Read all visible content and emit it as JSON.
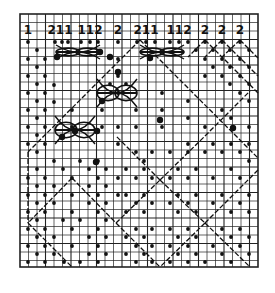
{
  "diagram": {
    "type": "bobbin-lace-pricking",
    "colors": {
      "background": "#ffffff",
      "ink": "#111111",
      "grid": "#222222"
    },
    "grid": {
      "x0": 20,
      "y0": 14,
      "x1": 258,
      "y1": 267,
      "cell": 8.5
    },
    "pair_labels": [
      {
        "text": "1",
        "x": 28
      },
      {
        "text": "211",
        "x": 60
      },
      {
        "text": "112",
        "x": 90
      },
      {
        "text": "2",
        "x": 118
      },
      {
        "text": "211",
        "x": 146
      },
      {
        "text": "112",
        "x": 179
      },
      {
        "text": "2",
        "x": 205
      },
      {
        "text": "2",
        "x": 222
      },
      {
        "text": "2",
        "x": 240
      }
    ],
    "label_y": 34,
    "diagonals": [
      [
        140,
        40,
        28,
        152
      ],
      [
        28,
        152,
        28,
        223
      ],
      [
        140,
        40,
        258,
        158
      ],
      [
        28,
        223,
        72,
        267
      ],
      [
        72,
        178,
        116,
        223
      ],
      [
        72,
        178,
        28,
        223
      ],
      [
        116,
        223,
        160,
        180
      ],
      [
        116,
        223,
        160,
        267
      ],
      [
        160,
        180,
        205,
        223
      ],
      [
        160,
        180,
        116,
        136
      ],
      [
        160,
        180,
        205,
        136
      ],
      [
        205,
        223,
        250,
        267
      ],
      [
        205,
        223,
        160,
        267
      ],
      [
        205,
        223,
        258,
        170
      ],
      [
        205,
        136,
        250,
        91
      ],
      [
        205,
        40,
        258,
        93
      ],
      [
        222,
        40,
        258,
        76
      ],
      [
        240,
        40,
        258,
        58
      ],
      [
        205,
        40,
        188,
        57
      ],
      [
        222,
        40,
        205,
        57
      ],
      [
        240,
        40,
        222,
        57
      ]
    ],
    "pins": [
      [
        28,
        42
      ],
      [
        55,
        42
      ],
      [
        62,
        42
      ],
      [
        68,
        42
      ],
      [
        81,
        42
      ],
      [
        90,
        42
      ],
      [
        98,
        42
      ],
      [
        118,
        42
      ],
      [
        137,
        42
      ],
      [
        146,
        42
      ],
      [
        155,
        42
      ],
      [
        170,
        42
      ],
      [
        179,
        42
      ],
      [
        188,
        42
      ],
      [
        205,
        42
      ],
      [
        222,
        42
      ],
      [
        240,
        42
      ],
      [
        37,
        50
      ],
      [
        28,
        59
      ],
      [
        45,
        59
      ],
      [
        37,
        67
      ],
      [
        28,
        76
      ],
      [
        45,
        76
      ],
      [
        37,
        84
      ],
      [
        28,
        93
      ],
      [
        45,
        93
      ],
      [
        54,
        85
      ],
      [
        37,
        101
      ],
      [
        28,
        110
      ],
      [
        45,
        110
      ],
      [
        54,
        102
      ],
      [
        37,
        118
      ],
      [
        28,
        127
      ],
      [
        45,
        127
      ],
      [
        37,
        135
      ],
      [
        28,
        144
      ],
      [
        45,
        144
      ],
      [
        37,
        152
      ],
      [
        118,
        59
      ],
      [
        118,
        76
      ],
      [
        110,
        84
      ],
      [
        126,
        84
      ],
      [
        118,
        93
      ],
      [
        102,
        110
      ],
      [
        136,
        110
      ],
      [
        118,
        127
      ],
      [
        102,
        127
      ],
      [
        136,
        127
      ],
      [
        118,
        144
      ],
      [
        72,
        127
      ],
      [
        72,
        110
      ],
      [
        196,
        50
      ],
      [
        213,
        50
      ],
      [
        230,
        50
      ],
      [
        249,
        50
      ],
      [
        205,
        59
      ],
      [
        222,
        59
      ],
      [
        240,
        59
      ],
      [
        213,
        67
      ],
      [
        230,
        67
      ],
      [
        249,
        67
      ],
      [
        222,
        76
      ],
      [
        240,
        76
      ],
      [
        230,
        84
      ],
      [
        249,
        84
      ],
      [
        240,
        93
      ],
      [
        249,
        101
      ],
      [
        205,
        76
      ],
      [
        188,
        101
      ],
      [
        162,
        93
      ],
      [
        162,
        110
      ],
      [
        188,
        118
      ],
      [
        162,
        127
      ],
      [
        205,
        127
      ],
      [
        231,
        118
      ],
      [
        222,
        110
      ],
      [
        249,
        127
      ],
      [
        188,
        144
      ],
      [
        213,
        144
      ],
      [
        231,
        144
      ],
      [
        249,
        144
      ],
      [
        54,
        161
      ],
      [
        80,
        161
      ],
      [
        98,
        161
      ],
      [
        37,
        169
      ],
      [
        63,
        169
      ],
      [
        89,
        169
      ],
      [
        106,
        169
      ],
      [
        28,
        178
      ],
      [
        45,
        178
      ],
      [
        72,
        178
      ],
      [
        98,
        178
      ],
      [
        118,
        178
      ],
      [
        37,
        186
      ],
      [
        54,
        186
      ],
      [
        89,
        186
      ],
      [
        106,
        186
      ],
      [
        28,
        195
      ],
      [
        45,
        195
      ],
      [
        72,
        195
      ],
      [
        98,
        195
      ],
      [
        118,
        195
      ],
      [
        37,
        203
      ],
      [
        54,
        203
      ],
      [
        89,
        203
      ],
      [
        106,
        203
      ],
      [
        28,
        212
      ],
      [
        45,
        212
      ],
      [
        72,
        212
      ],
      [
        98,
        212
      ],
      [
        37,
        220
      ],
      [
        63,
        220
      ],
      [
        80,
        220
      ],
      [
        106,
        220
      ],
      [
        28,
        229
      ],
      [
        45,
        229
      ],
      [
        72,
        229
      ],
      [
        98,
        229
      ],
      [
        37,
        237
      ],
      [
        54,
        237
      ],
      [
        89,
        237
      ],
      [
        106,
        237
      ],
      [
        28,
        246
      ],
      [
        45,
        246
      ],
      [
        72,
        246
      ],
      [
        98,
        246
      ],
      [
        37,
        254
      ],
      [
        54,
        254
      ],
      [
        89,
        254
      ],
      [
        106,
        254
      ],
      [
        28,
        262
      ],
      [
        45,
        262
      ],
      [
        64,
        262
      ],
      [
        80,
        262
      ],
      [
        98,
        262
      ],
      [
        136,
        152
      ],
      [
        152,
        152
      ],
      [
        170,
        152
      ],
      [
        188,
        152
      ],
      [
        205,
        152
      ],
      [
        222,
        152
      ],
      [
        240,
        152
      ],
      [
        249,
        161
      ],
      [
        144,
        161
      ],
      [
        126,
        169
      ],
      [
        144,
        169
      ],
      [
        178,
        169
      ],
      [
        196,
        169
      ],
      [
        231,
        169
      ],
      [
        136,
        178
      ],
      [
        152,
        178
      ],
      [
        170,
        178
      ],
      [
        188,
        178
      ],
      [
        213,
        178
      ],
      [
        240,
        178
      ],
      [
        126,
        195
      ],
      [
        144,
        195
      ],
      [
        178,
        195
      ],
      [
        196,
        195
      ],
      [
        222,
        195
      ],
      [
        249,
        195
      ],
      [
        136,
        203
      ],
      [
        152,
        203
      ],
      [
        170,
        203
      ],
      [
        188,
        203
      ],
      [
        213,
        203
      ],
      [
        240,
        203
      ],
      [
        126,
        212
      ],
      [
        144,
        212
      ],
      [
        178,
        212
      ],
      [
        196,
        212
      ],
      [
        231,
        212
      ],
      [
        249,
        212
      ],
      [
        136,
        229
      ],
      [
        152,
        229
      ],
      [
        170,
        229
      ],
      [
        188,
        229
      ],
      [
        222,
        229
      ],
      [
        240,
        229
      ],
      [
        126,
        237
      ],
      [
        144,
        237
      ],
      [
        178,
        237
      ],
      [
        196,
        237
      ],
      [
        231,
        237
      ],
      [
        249,
        237
      ],
      [
        136,
        246
      ],
      [
        152,
        246
      ],
      [
        170,
        246
      ],
      [
        188,
        246
      ],
      [
        213,
        246
      ],
      [
        240,
        246
      ],
      [
        126,
        254
      ],
      [
        144,
        254
      ],
      [
        178,
        254
      ],
      [
        196,
        254
      ],
      [
        222,
        254
      ],
      [
        249,
        254
      ],
      [
        136,
        262
      ],
      [
        152,
        262
      ],
      [
        170,
        262
      ],
      [
        188,
        262
      ],
      [
        205,
        262
      ],
      [
        231,
        262
      ]
    ],
    "large_pins": [
      [
        110,
        57
      ],
      [
        118,
        72
      ],
      [
        102,
        101
      ],
      [
        150,
        58
      ],
      [
        75,
        131
      ],
      [
        62,
        137
      ],
      [
        97,
        131
      ],
      [
        96,
        162
      ],
      [
        160,
        120
      ],
      [
        233,
        128
      ],
      [
        57,
        57
      ],
      [
        100,
        52
      ]
    ],
    "motifs": [
      {
        "name": "spider-top-left",
        "cx": 78,
        "cy": 52,
        "rx": 22,
        "ry": 7
      },
      {
        "name": "spider-top-right",
        "cx": 162,
        "cy": 52,
        "rx": 22,
        "ry": 7
      },
      {
        "name": "spider-center",
        "cx": 117,
        "cy": 93,
        "rx": 20,
        "ry": 14
      },
      {
        "name": "spider-left",
        "cx": 75,
        "cy": 130,
        "rx": 20,
        "ry": 14
      }
    ]
  }
}
